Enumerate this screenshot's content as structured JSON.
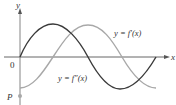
{
  "figure": {
    "axes": {
      "x_label": "x",
      "y_label": "y",
      "origin_label": "0",
      "point_label": "P"
    },
    "curves": [
      {
        "id": "f_prime",
        "label": "y = f′(x)",
        "color": "#a8a8a8",
        "description": "cosine-like curve starting at minimum at P, peaking mid-range"
      },
      {
        "id": "f_double_prime",
        "label": "y = f″(x)",
        "color": "#3a3a3a",
        "description": "sine-like curve starting at origin, peak then trough"
      }
    ],
    "colors": {
      "axis": "#555555",
      "text": "#333333",
      "point": "#a8a8a8"
    }
  }
}
